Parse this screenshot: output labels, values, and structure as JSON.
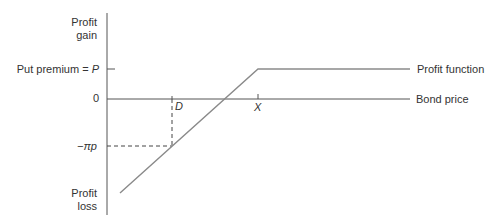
{
  "diagram": {
    "type": "put-option-profit-function",
    "y_axis": {
      "top_label_line1": "Profit",
      "top_label_line2": "gain",
      "bottom_label_line1": "Profit",
      "bottom_label_line2": "loss",
      "ticks": {
        "premium_prefix": "Put premium = ",
        "premium_symbol": "P",
        "zero": "0",
        "loss_level": "−πp"
      }
    },
    "x_axis": {
      "label": "Bond price",
      "ticks": {
        "d": "D",
        "x": "X"
      }
    },
    "series": {
      "profit_function_label": "Profit function"
    },
    "colors": {
      "axis": "#555555",
      "profit_line": "#8a8a8a",
      "dashed": "#444444",
      "text": "#333333"
    }
  }
}
